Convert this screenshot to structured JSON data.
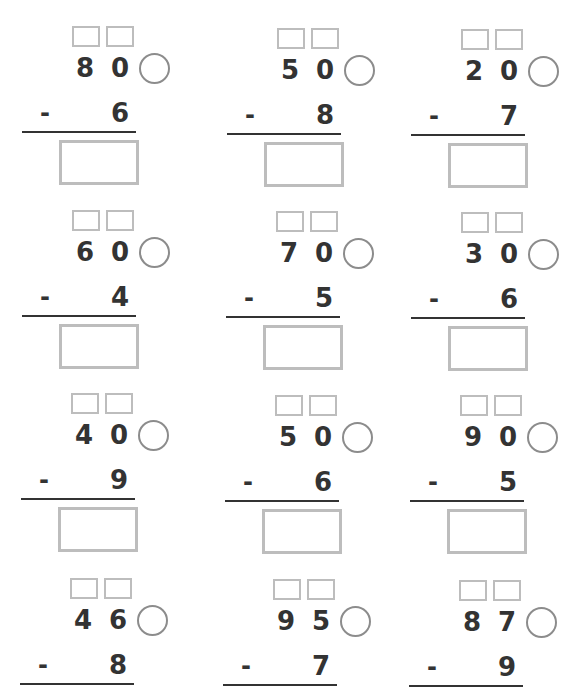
{
  "worksheet": {
    "type": "two-digit minus one-digit subtraction with regrouping",
    "problems": [
      {
        "tens": "8",
        "ones": "0",
        "operator": "-",
        "subtrahend": "6",
        "has_answer_box": true
      },
      {
        "tens": "5",
        "ones": "0",
        "operator": "-",
        "subtrahend": "8",
        "has_answer_box": true
      },
      {
        "tens": "2",
        "ones": "0",
        "operator": "-",
        "subtrahend": "7",
        "has_answer_box": true
      },
      {
        "tens": "6",
        "ones": "0",
        "operator": "-",
        "subtrahend": "4",
        "has_answer_box": true
      },
      {
        "tens": "7",
        "ones": "0",
        "operator": "-",
        "subtrahend": "5",
        "has_answer_box": true
      },
      {
        "tens": "3",
        "ones": "0",
        "operator": "-",
        "subtrahend": "6",
        "has_answer_box": true
      },
      {
        "tens": "4",
        "ones": "0",
        "operator": "-",
        "subtrahend": "9",
        "has_answer_box": true
      },
      {
        "tens": "5",
        "ones": "0",
        "operator": "-",
        "subtrahend": "6",
        "has_answer_box": true
      },
      {
        "tens": "9",
        "ones": "0",
        "operator": "-",
        "subtrahend": "5",
        "has_answer_box": true
      },
      {
        "tens": "4",
        "ones": "6",
        "operator": "-",
        "subtrahend": "8",
        "has_answer_box": false
      },
      {
        "tens": "9",
        "ones": "5",
        "operator": "-",
        "subtrahend": "7",
        "has_answer_box": false
      },
      {
        "tens": "8",
        "ones": "7",
        "operator": "-",
        "subtrahend": "9",
        "has_answer_box": false
      }
    ]
  },
  "colors": {
    "digits": "#333333",
    "small_boxes": "#bdbdbd",
    "circle": "#8c8c8c",
    "answer_box": "#bdbdbd",
    "rule": "#333333"
  }
}
